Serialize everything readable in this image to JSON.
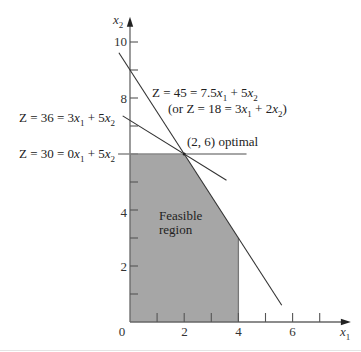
{
  "colors": {
    "background": "#ffffff",
    "feasible_fill": "#a6a6a6",
    "feasible_edge": "#777777",
    "axis": "#666666",
    "tick": "#555555",
    "bottom_rule": "#e4e4e4"
  },
  "chart_data": {
    "type": "line",
    "title": "",
    "xlabel": "x₁",
    "ylabel": "x₂",
    "xlim": [
      0,
      8.15
    ],
    "ylim": [
      0,
      10.9
    ],
    "grid": false,
    "legend": null,
    "x_ticks": [
      1,
      2,
      3,
      4,
      5,
      6,
      7
    ],
    "y_ticks": [
      1,
      2,
      3,
      4,
      5,
      6,
      7,
      8,
      9,
      10
    ],
    "x_tick_labels": {
      "origin": "0",
      "t2": "2",
      "t4": "4",
      "t6": "6"
    },
    "y_tick_labels": {
      "t2": "2",
      "t4": "4",
      "t8": "8",
      "t10": "10"
    },
    "series": [
      {
        "name": "Z = 45 = 7.5x₁ + 5x₂",
        "equation": {
          "a": 7.5,
          "b": 5,
          "c": 45
        },
        "x_range": [
          -0.41,
          5.6
        ],
        "color": "#333333",
        "width": 1.1
      },
      {
        "name": "Z = 36 = 3x₁ + 5x₂",
        "equation": {
          "a": 3,
          "b": 5,
          "c": 36
        },
        "x_range": [
          -0.27,
          3.56
        ],
        "color": "#333333",
        "width": 1.1
      },
      {
        "name": "Z = 30 = 0x₁ + 5x₂",
        "equation": {
          "a": 0,
          "b": 5,
          "c": 30
        },
        "x_range": [
          -0.44,
          4.3
        ],
        "color": "#888888",
        "width": 1.4
      }
    ],
    "feasible_region": {
      "label": "Feasible region",
      "vertices": [
        [
          0,
          0
        ],
        [
          0,
          6
        ],
        [
          2,
          6
        ],
        [
          4,
          3
        ],
        [
          4,
          0
        ]
      ],
      "edge_x4": [
        [
          4,
          0
        ],
        [
          4,
          3
        ]
      ]
    },
    "optimal_point": {
      "x": 2,
      "y": 6,
      "label": "(2, 6) optimal"
    },
    "annotations": {
      "z45": "Z = 45 = 7.5x₁ + 5x₂",
      "z45_alt": "(or Z = 18 = 3x₁ + 2x₂)",
      "optimal": "(2, 6) optimal",
      "z36": "Z = 36 = 3x₁ + 5x₂",
      "z30": "Z = 30 = 0x₁ + 5x₂",
      "region_line1": "Feasible",
      "region_line2": "region"
    }
  }
}
